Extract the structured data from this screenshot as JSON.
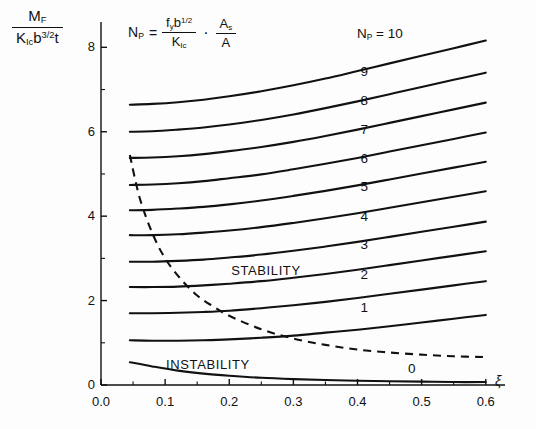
{
  "chart_data": {
    "type": "line",
    "title": "",
    "subtitle": "",
    "ylabel_parts": {
      "numerator_base": "M",
      "numerator_sub": "F",
      "den_k": "K",
      "den_k_sub": "Ic",
      "den_b": "b",
      "den_b_sup": "3/2",
      "den_t": "t"
    },
    "xlabel": "ξ",
    "formula": {
      "lhs_base": "N",
      "lhs_sub": "P",
      "equals": "=",
      "num_f": "f",
      "num_f_sub": "y",
      "num_b": "b",
      "num_b_sup": "1/2",
      "den_k": "K",
      "den_k_sub": "Ic",
      "dot": "·",
      "frac2_num": "A",
      "frac2_num_sub": "s",
      "frac2_den": "A"
    },
    "xlim": [
      0.0,
      0.63
    ],
    "ylim": [
      0.0,
      8.6
    ],
    "xticks": [
      0.0,
      0.1,
      0.2,
      0.3,
      0.4,
      0.5,
      0.6
    ],
    "xtick_labels": [
      "0.0",
      "0.1",
      "0.2",
      "0.3",
      "0.4",
      "0.5",
      "0.6"
    ],
    "xminor_ticks": [
      0.05,
      0.15,
      0.25,
      0.35,
      0.45,
      0.55
    ],
    "yticks": [
      0,
      2,
      4,
      6,
      8
    ],
    "ytick_labels": [
      "0",
      "2",
      "4",
      "6",
      "8"
    ],
    "yminor_ticks": [
      1,
      3,
      5,
      7
    ],
    "grid": false,
    "legend_position": "inline-right-of-curves",
    "annotations": [
      {
        "text": "STABILITY",
        "x": 0.255,
        "y": 2.68
      },
      {
        "text": "INSTABILITY",
        "x": 0.165,
        "y": 0.44
      }
    ],
    "series_label_prefix": "N_P =",
    "x": [
      0.045,
      0.08,
      0.12,
      0.16,
      0.2,
      0.25,
      0.3,
      0.35,
      0.4,
      0.45,
      0.5,
      0.55,
      0.6
    ],
    "series": [
      {
        "name": "10",
        "label": "Nₚ = 10",
        "style": "solid",
        "values": [
          6.64,
          6.66,
          6.7,
          6.76,
          6.84,
          6.96,
          7.1,
          7.26,
          7.44,
          7.62,
          7.8,
          7.98,
          8.16
        ]
      },
      {
        "name": "9",
        "label": "9",
        "style": "solid",
        "values": [
          6.0,
          6.01,
          6.05,
          6.1,
          6.17,
          6.28,
          6.41,
          6.56,
          6.72,
          6.89,
          7.06,
          7.23,
          7.4
        ]
      },
      {
        "name": "8",
        "label": "8",
        "style": "solid",
        "values": [
          5.38,
          5.39,
          5.42,
          5.47,
          5.54,
          5.64,
          5.76,
          5.9,
          6.05,
          6.21,
          6.37,
          6.53,
          6.69
        ]
      },
      {
        "name": "7",
        "label": "7",
        "style": "solid",
        "values": [
          4.74,
          4.75,
          4.78,
          4.83,
          4.9,
          4.99,
          5.11,
          5.24,
          5.38,
          5.53,
          5.68,
          5.83,
          5.98
        ]
      },
      {
        "name": "6",
        "label": "6",
        "style": "solid",
        "values": [
          4.14,
          4.15,
          4.18,
          4.22,
          4.28,
          4.37,
          4.48,
          4.6,
          4.73,
          4.87,
          5.01,
          5.15,
          5.29
        ]
      },
      {
        "name": "5",
        "label": "5",
        "style": "solid",
        "values": [
          3.55,
          3.55,
          3.57,
          3.61,
          3.66,
          3.74,
          3.84,
          3.95,
          4.07,
          4.2,
          4.33,
          4.46,
          4.59
        ]
      },
      {
        "name": "4",
        "label": "4",
        "style": "solid",
        "values": [
          2.92,
          2.92,
          2.94,
          2.97,
          3.02,
          3.09,
          3.18,
          3.28,
          3.39,
          3.51,
          3.63,
          3.75,
          3.87
        ]
      },
      {
        "name": "3",
        "label": "3",
        "style": "solid",
        "values": [
          2.32,
          2.32,
          2.33,
          2.36,
          2.4,
          2.46,
          2.54,
          2.63,
          2.73,
          2.84,
          2.95,
          3.06,
          3.17
        ]
      },
      {
        "name": "2",
        "label": "2",
        "style": "solid",
        "values": [
          1.7,
          1.7,
          1.71,
          1.73,
          1.76,
          1.82,
          1.89,
          1.97,
          2.06,
          2.16,
          2.26,
          2.36,
          2.46
        ]
      },
      {
        "name": "1",
        "label": "1",
        "style": "solid",
        "values": [
          1.06,
          1.05,
          1.05,
          1.06,
          1.08,
          1.12,
          1.17,
          1.24,
          1.31,
          1.39,
          1.48,
          1.57,
          1.66
        ]
      },
      {
        "name": "0",
        "label": "0",
        "style": "solid",
        "values": [
          0.54,
          0.44,
          0.34,
          0.27,
          0.22,
          0.17,
          0.14,
          0.12,
          0.1,
          0.09,
          0.08,
          0.07,
          0.07
        ]
      }
    ],
    "boundary_curve": {
      "name": "stability-boundary",
      "style": "dashed",
      "x": [
        0.045,
        0.06,
        0.08,
        0.1,
        0.125,
        0.15,
        0.175,
        0.2,
        0.25,
        0.3,
        0.35,
        0.4,
        0.45,
        0.5,
        0.55,
        0.6
      ],
      "values": [
        5.45,
        4.45,
        3.6,
        3.0,
        2.5,
        2.12,
        1.86,
        1.64,
        1.32,
        1.1,
        0.95,
        0.84,
        0.77,
        0.72,
        0.68,
        0.66
      ]
    }
  }
}
